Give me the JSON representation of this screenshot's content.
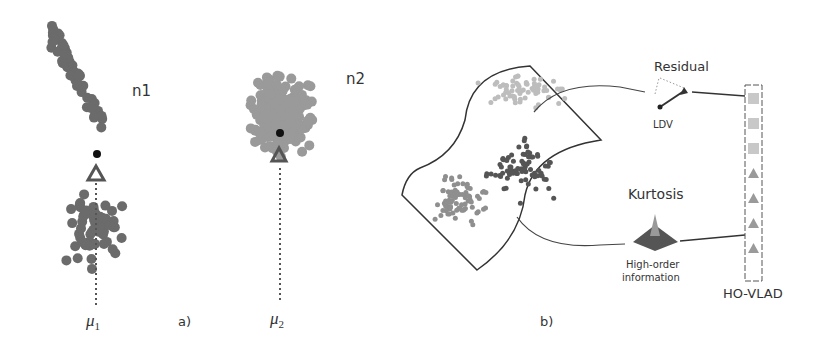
{
  "panel_a": {
    "caption": "a)",
    "cluster1": {
      "label": "n1",
      "mean_label": "μ",
      "mean_sub": "1",
      "dot_color": "#6b6b6b"
    },
    "cluster2": {
      "label": "n2",
      "mean_label": "μ",
      "mean_sub": "2",
      "dot_color": "#9a9a9a"
    }
  },
  "panel_b": {
    "caption": "b)",
    "residual_label": "Residual",
    "ldv_label": "LDV",
    "kurtosis_label": "Kurtosis",
    "high_order_line1": "High-order",
    "high_order_line2": "information",
    "vector_label": "HO-VLAD",
    "vector_entries": [
      "square",
      "square",
      "square",
      "triangle",
      "triangle",
      "triangle",
      "triangle"
    ],
    "colors": {
      "light": "#bdbdbd",
      "mid": "#8f8f8f",
      "dark": "#555555",
      "outline": "#333333"
    }
  }
}
